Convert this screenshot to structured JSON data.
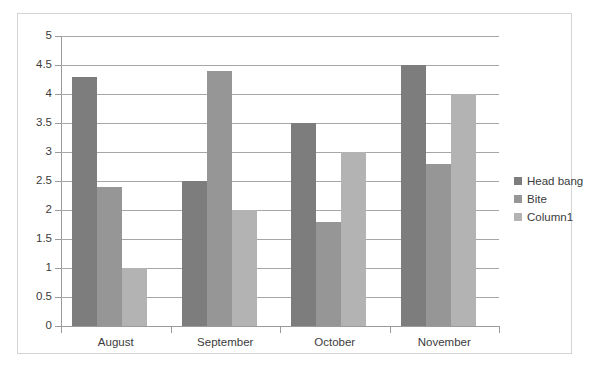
{
  "chart_data": {
    "type": "bar",
    "title": "",
    "subtitle": "",
    "xlabel": "",
    "ylabel": "",
    "categories": [
      "August",
      "September",
      "October",
      "November"
    ],
    "series": [
      {
        "name": "Head bang",
        "color": "#7d7d7d",
        "values": [
          4.3,
          2.5,
          3.5,
          4.5
        ]
      },
      {
        "name": "Bite",
        "color": "#969696",
        "values": [
          2.4,
          4.4,
          1.8,
          2.8
        ]
      },
      {
        "name": "Column1",
        "color": "#b3b3b3",
        "values": [
          1.0,
          2.0,
          3.0,
          4.0
        ]
      }
    ],
    "ylim": [
      0,
      5
    ],
    "ytick_step": 0.5,
    "yticks": [
      "0",
      "0.5",
      "1",
      "1.5",
      "2",
      "2.5",
      "3",
      "3.5",
      "4",
      "4.5",
      "5"
    ],
    "grid": true,
    "grid_axis": "y",
    "legend": true,
    "legend_position": "right",
    "annotations": []
  },
  "style": {
    "background": "#ffffff",
    "border_color": "#d4d4d4",
    "grid_color": "#a6a6a6",
    "axis_color": "#9a9a9a",
    "text_color": "#3b3b3b"
  }
}
